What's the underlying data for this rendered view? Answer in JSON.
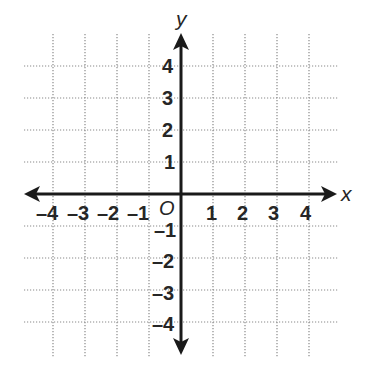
{
  "diagram": {
    "type": "coordinate-plane",
    "x_axis": {
      "name": "x",
      "min": -4,
      "max": 4,
      "tick_labels": [
        "–4",
        "–3",
        "–2",
        "–1",
        "1",
        "2",
        "3",
        "4"
      ],
      "tick_values": [
        -4,
        -3,
        -2,
        -1,
        1,
        2,
        3,
        4
      ]
    },
    "y_axis": {
      "name": "y",
      "min": -4,
      "max": 4,
      "tick_labels": [
        "4",
        "3",
        "2",
        "1",
        "–1",
        "–2",
        "–3",
        "–4"
      ],
      "tick_values": [
        4,
        3,
        2,
        1,
        -1,
        -2,
        -3,
        -4
      ]
    },
    "origin_label": "O",
    "grid": {
      "style": "dotted",
      "spacing_units": 1,
      "color": "#8a8a8a"
    },
    "axis_color": "#1a1a1a"
  }
}
